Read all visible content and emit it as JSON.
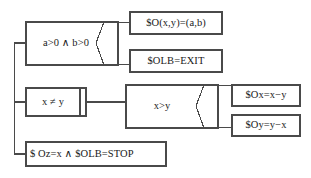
{
  "diagram": {
    "type": "nassi-shneiderman-structogram",
    "stroke_color": "#4a4a4a",
    "text_color": "#1a1a1a",
    "background_color": "#ffffff",
    "nodes": [
      {
        "id": "cond-ab",
        "kind": "decision-box",
        "label": "a>0 ∧ b>0",
        "x": 26,
        "y": 22,
        "w": 92,
        "h": 43
      },
      {
        "id": "assign-oxy",
        "kind": "process-box",
        "label": "$O(x,y)=(a,b)",
        "x": 130,
        "y": 12,
        "w": 92,
        "h": 22
      },
      {
        "id": "assign-olb-exit",
        "kind": "process-box",
        "label": "$OLB=EXIT",
        "x": 130,
        "y": 50,
        "w": 92,
        "h": 22
      },
      {
        "id": "loop-xney",
        "kind": "loop-box",
        "label": "x ≠ y",
        "x": 26,
        "y": 88,
        "w": 60,
        "h": 28
      },
      {
        "id": "cond-xgty",
        "kind": "decision-box",
        "label": "x>y",
        "x": 126,
        "y": 85,
        "w": 92,
        "h": 43
      },
      {
        "id": "assign-ox",
        "kind": "process-box",
        "label": "$Ox=x−y",
        "x": 232,
        "y": 85,
        "w": 68,
        "h": 21
      },
      {
        "id": "assign-oy",
        "kind": "process-box",
        "label": "$Oy=y−x",
        "x": 232,
        "y": 115,
        "w": 68,
        "h": 21
      },
      {
        "id": "assign-oz-stop",
        "kind": "process-box",
        "label": "$ Oz=x ∧ $OLB=STOP",
        "x": 26,
        "y": 142,
        "w": 140,
        "h": 24
      }
    ],
    "connectors": [
      {
        "id": "spine",
        "from": "root",
        "to": "rows"
      },
      {
        "id": "spine-to-cond-ab",
        "from": "spine",
        "to": "cond-ab"
      },
      {
        "id": "spine-to-loop",
        "from": "spine",
        "to": "loop-xney"
      },
      {
        "id": "spine-to-oz",
        "from": "spine",
        "to": "assign-oz-stop"
      },
      {
        "id": "cond-ab-true",
        "from": "cond-ab",
        "to": "assign-oxy"
      },
      {
        "id": "cond-ab-false",
        "from": "cond-ab",
        "to": "assign-olb-exit"
      },
      {
        "id": "loop-to-cond-xgty",
        "from": "loop-xney",
        "to": "cond-xgty"
      },
      {
        "id": "cond-xgty-true",
        "from": "cond-xgty",
        "to": "assign-ox"
      },
      {
        "id": "cond-xgty-false",
        "from": "cond-xgty",
        "to": "assign-oy"
      }
    ]
  }
}
